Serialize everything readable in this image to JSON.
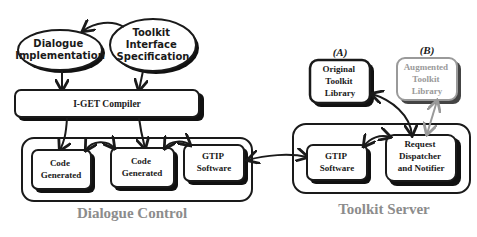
{
  "diagram": {
    "top_inputs": {
      "dialogue_implementation": [
        "Dialogue",
        "Implementation"
      ],
      "toolkit_interface_spec": [
        "Toolkit",
        "Interface",
        "Specification"
      ]
    },
    "compiler": {
      "label": "I-GET Compiler"
    },
    "dialogue_control": {
      "caption": "Dialogue Control",
      "code_generated_1": [
        "Code",
        "Generated"
      ],
      "code_generated_2": [
        "Code",
        "Generated"
      ],
      "gtip_software": [
        "GTIP",
        "Software"
      ]
    },
    "toolkit_server": {
      "caption": "Toolkit Server",
      "gtip_software": [
        "GTIP",
        "Software"
      ],
      "request_dispatcher": [
        "Request",
        "Dispatcher",
        "and Notifier"
      ]
    },
    "libraries": {
      "original": {
        "tag": "(A)",
        "label": [
          "Original",
          "Toolkit",
          "Library"
        ]
      },
      "augmented": {
        "tag": "(B)",
        "label": [
          "Augmented",
          "Toolkit",
          "Library"
        ]
      }
    },
    "colors": {
      "ink": "#1a1a1a",
      "shadow": "#111111",
      "augmented_gray": "#9a9a9a",
      "caption_gray": "#8c8c8c",
      "background": "#ffffff"
    }
  }
}
